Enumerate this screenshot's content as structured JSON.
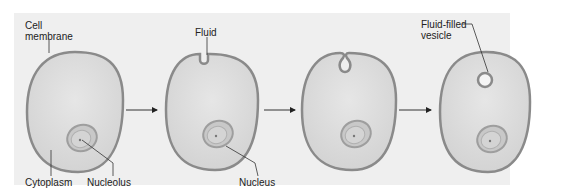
{
  "diagram": {
    "stages": [
      {
        "id": 1,
        "description": "Resting cell"
      },
      {
        "id": 2,
        "description": "Membrane invaginates around fluid"
      },
      {
        "id": 3,
        "description": "Invagination pinches inward"
      },
      {
        "id": 4,
        "description": "Fluid-filled vesicle inside cell"
      }
    ],
    "labels": {
      "cell_membrane_line1": "Cell",
      "cell_membrane_line2": "membrane",
      "cytoplasm": "Cytoplasm",
      "nucleolus": "Nucleolus",
      "fluid": "Fluid",
      "nucleus": "Nucleus",
      "vesicle_line1": "Fluid-filled",
      "vesicle_line2": "vesicle"
    },
    "colors": {
      "panel_bg": "#efefef",
      "membrane": "#8a8a8a",
      "cytoplasm": "#dcdcdc",
      "nucleus_ring": "#a8a8a8",
      "nucleus_fill": "#cfcfcf",
      "arrow": "#333333",
      "leader_line": "#333333"
    }
  }
}
